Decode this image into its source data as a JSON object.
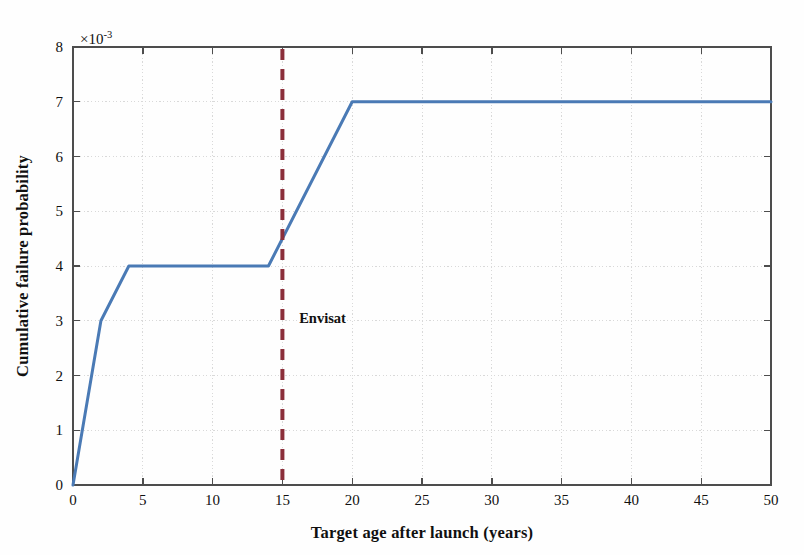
{
  "figure": {
    "background_color": "#fefefe",
    "plot_area": {
      "left": 73,
      "top": 47,
      "right": 771,
      "bottom": 485
    },
    "axis_color": "#4d4d4d",
    "grid_color": "#d9d9d9"
  },
  "chart_data": {
    "type": "line",
    "title": "",
    "subtitle": "",
    "xlabel": "Target age after launch (years)",
    "ylabel": "Cumulative failure probability",
    "y_exponent_label": "×10",
    "y_exponent_power": "-3",
    "y_scale_factor": 0.001,
    "xlim": [
      0,
      50
    ],
    "ylim": [
      0,
      8
    ],
    "xticks": [
      0,
      5,
      10,
      15,
      20,
      25,
      30,
      35,
      40,
      45,
      50
    ],
    "xtick_labels": [
      "0",
      "5",
      "10",
      "15",
      "20",
      "25",
      "30",
      "35",
      "40",
      "45",
      "50"
    ],
    "yticks": [
      0,
      1,
      2,
      3,
      4,
      5,
      6,
      7,
      8
    ],
    "ytick_labels": [
      "0",
      "1",
      "2",
      "3",
      "4",
      "5",
      "6",
      "7",
      "8"
    ],
    "grid": true,
    "legend": false,
    "legend_position": "none",
    "series": [
      {
        "name": "Cumulative failure probability",
        "color": "#4a7ab5",
        "line_width": 3,
        "style": "solid",
        "x": [
          0,
          2,
          4,
          14,
          20,
          50
        ],
        "y": [
          0,
          3,
          4,
          4,
          7,
          7
        ]
      }
    ],
    "annotations": [
      {
        "name": "envisat-marker",
        "type": "vline",
        "label": "Envisat",
        "x": 15,
        "color": "#8b2f3a",
        "style": "dashed",
        "line_width": 4,
        "label_x": 16.2,
        "label_y": 3.05
      }
    ]
  }
}
